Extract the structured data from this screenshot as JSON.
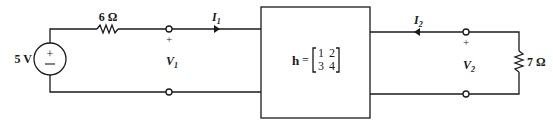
{
  "source": {
    "label": "5 V",
    "plus": "+",
    "minus": "−"
  },
  "resistor_left": {
    "label": "6 Ω"
  },
  "resistor_right": {
    "label": "7 Ω"
  },
  "port1": {
    "current": "I",
    "current_sub": "1",
    "voltage": "V",
    "voltage_sub": "1",
    "plus": "+"
  },
  "port2": {
    "current": "I",
    "current_sub": "2",
    "voltage": "V",
    "voltage_sub": "2",
    "plus": "+"
  },
  "two_port": {
    "symbol": "h",
    "equals": "=",
    "matrix": [
      [
        "1",
        "2"
      ],
      [
        "3",
        "4"
      ]
    ]
  }
}
